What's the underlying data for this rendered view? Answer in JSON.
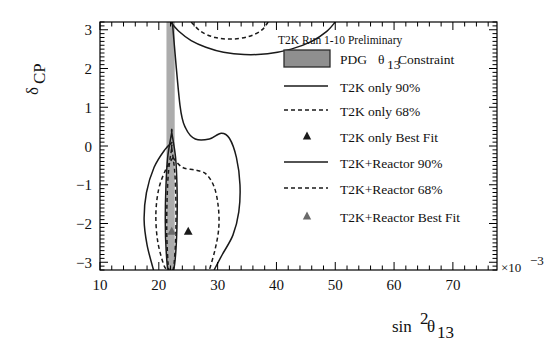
{
  "figure": {
    "preliminary_label": "T2K Run 1-10 Preliminary"
  },
  "axes": {
    "x": {
      "label_main": "sin",
      "label_sup": "2",
      "label_theta": "θ",
      "label_sub": "13",
      "ticks": [
        "10",
        "20",
        "30",
        "40",
        "50",
        "60",
        "70"
      ],
      "exponent_mult": "×10",
      "exponent_pow": "−3",
      "min": 10,
      "max": 77.5
    },
    "y": {
      "label_main": "δ",
      "label_sub": "CP",
      "ticks": [
        "3",
        "2",
        "1",
        "0",
        "−1",
        "−2",
        "−3"
      ],
      "min": -3.2,
      "max": 3.2
    }
  },
  "legend": {
    "entries": [
      {
        "key": "pdg",
        "marker": "swatch",
        "label_pre": "PDG ",
        "label_theta": "θ",
        "label_sub": "13",
        "label_post": " Constraint"
      },
      {
        "key": "t2k90",
        "marker": "solid-line",
        "label": "T2K only 90%"
      },
      {
        "key": "t2k68",
        "marker": "dashed-line",
        "label": "T2K only 68%"
      },
      {
        "key": "t2kbf",
        "marker": "triangle",
        "label": "T2K only Best Fit"
      },
      {
        "key": "reac90",
        "marker": "solid-line",
        "label": "T2K+Reactor 90%"
      },
      {
        "key": "reac68",
        "marker": "dashed-line",
        "label": "T2K+Reactor 68%"
      },
      {
        "key": "reacbf",
        "marker": "triangle",
        "label": "T2K+Reactor Best Fit"
      }
    ]
  },
  "colors": {
    "band_gray": "#9d9d9d",
    "legend_swatch": "#8f8f8f",
    "contour_line": "#1a1a1a",
    "marker_dark": "#1a1a1a",
    "marker_gray": "#6a6a6a",
    "frame": "#000000"
  },
  "chart_data": {
    "type": "line",
    "title": "T2K Run 1-10 Preliminary",
    "xlabel": "sin^2(theta_13) (x10^-3)",
    "ylabel": "delta_CP",
    "xlim": [
      10,
      77.5
    ],
    "ylim": [
      -3.2,
      3.2
    ],
    "grid": false,
    "legend_position": "right-inside",
    "bands": [
      {
        "name": "PDG theta_13 Constraint",
        "orientation": "vertical",
        "x_min": 21.3,
        "x_max": 22.7,
        "y_min": -3.2,
        "y_max": 3.2,
        "color": "#9d9d9d"
      }
    ],
    "best_fit_points": [
      {
        "name": "T2K only Best Fit",
        "x": 25.0,
        "y": -2.2,
        "color": "#1a1a1a"
      },
      {
        "name": "T2K+Reactor Best Fit",
        "x": 22.2,
        "y": -2.2,
        "color": "#6a6a6a"
      }
    ],
    "series": [
      {
        "name": "T2K only 90%",
        "style": "solid",
        "closed": false,
        "note": "Upper lobe crosses top frame; lower lobe is a large closed-ish region",
        "segments": [
          {
            "id": "upper",
            "points": [
              [
                22.0,
                3.2
              ],
              [
                23.5,
                2.95
              ],
              [
                25.5,
                2.72
              ],
              [
                28.0,
                2.55
              ],
              [
                31.0,
                2.42
              ],
              [
                34.5,
                2.36
              ],
              [
                38.5,
                2.38
              ],
              [
                42.5,
                2.5
              ],
              [
                46.0,
                2.7
              ],
              [
                48.5,
                2.95
              ],
              [
                50.0,
                3.2
              ]
            ]
          },
          {
            "id": "lower",
            "points": [
              [
                22.3,
                3.2
              ],
              [
                23.6,
                1.05
              ],
              [
                24.6,
                0.45
              ],
              [
                26.2,
                0.18
              ],
              [
                28.6,
                0.18
              ],
              [
                30.6,
                0.33
              ],
              [
                32.0,
                0.2
              ],
              [
                33.2,
                -0.3
              ],
              [
                33.8,
                -1.0
              ],
              [
                33.6,
                -1.7
              ],
              [
                32.6,
                -2.3
              ],
              [
                30.8,
                -2.8
              ],
              [
                29.4,
                -3.2
              ]
            ]
          },
          {
            "id": "left-lobe",
            "points": [
              [
                22.3,
                0.1
              ],
              [
                21.0,
                -0.1
              ],
              [
                19.2,
                -0.55
              ],
              [
                17.9,
                -1.2
              ],
              [
                17.5,
                -1.9
              ],
              [
                18.0,
                -2.55
              ],
              [
                19.1,
                -3.2
              ]
            ]
          }
        ]
      },
      {
        "name": "T2K only 68%",
        "style": "dashed",
        "closed": false,
        "segments": [
          {
            "id": "upper",
            "points": [
              [
                25.5,
                3.2
              ],
              [
                27.2,
                2.95
              ],
              [
                29.6,
                2.8
              ],
              [
                32.4,
                2.76
              ],
              [
                35.2,
                2.82
              ],
              [
                37.4,
                2.98
              ],
              [
                38.6,
                3.2
              ]
            ]
          },
          {
            "id": "lower",
            "points": [
              [
                22.4,
                -0.3
              ],
              [
                24.0,
                -0.55
              ],
              [
                26.2,
                -0.62
              ],
              [
                28.0,
                -0.72
              ],
              [
                29.4,
                -1.05
              ],
              [
                30.1,
                -1.55
              ],
              [
                30.2,
                -2.1
              ],
              [
                29.6,
                -2.65
              ],
              [
                28.6,
                -3.2
              ]
            ]
          },
          {
            "id": "left-lobe",
            "points": [
              [
                22.4,
                -0.3
              ],
              [
                21.2,
                -0.6
              ],
              [
                20.0,
                -1.1
              ],
              [
                19.5,
                -1.75
              ],
              [
                19.8,
                -2.45
              ],
              [
                20.8,
                -3.05
              ],
              [
                21.4,
                -3.2
              ]
            ]
          }
        ]
      },
      {
        "name": "T2K+Reactor 90%",
        "style": "solid",
        "closed": true,
        "segments": [
          {
            "id": "lens",
            "points": [
              [
                22.2,
                0.35
              ],
              [
                22.85,
                -0.3
              ],
              [
                23.1,
                -1.1
              ],
              [
                23.1,
                -1.95
              ],
              [
                22.9,
                -2.7
              ],
              [
                22.5,
                -3.2
              ],
              [
                21.6,
                -3.2
              ],
              [
                21.25,
                -2.7
              ],
              [
                21.1,
                -1.95
              ],
              [
                21.2,
                -1.1
              ],
              [
                21.5,
                -0.3
              ],
              [
                22.2,
                0.35
              ]
            ]
          }
        ]
      },
      {
        "name": "T2K+Reactor 68%",
        "style": "dashed",
        "closed": true,
        "segments": [
          {
            "id": "lens",
            "points": [
              [
                22.2,
                -0.05
              ],
              [
                22.7,
                -0.65
              ],
              [
                22.9,
                -1.4
              ],
              [
                22.9,
                -2.2
              ],
              [
                22.7,
                -2.85
              ],
              [
                22.4,
                -3.2
              ],
              [
                21.75,
                -3.2
              ],
              [
                21.5,
                -2.85
              ],
              [
                21.35,
                -2.2
              ],
              [
                21.4,
                -1.4
              ],
              [
                21.65,
                -0.65
              ],
              [
                22.2,
                -0.05
              ]
            ]
          }
        ]
      }
    ]
  }
}
